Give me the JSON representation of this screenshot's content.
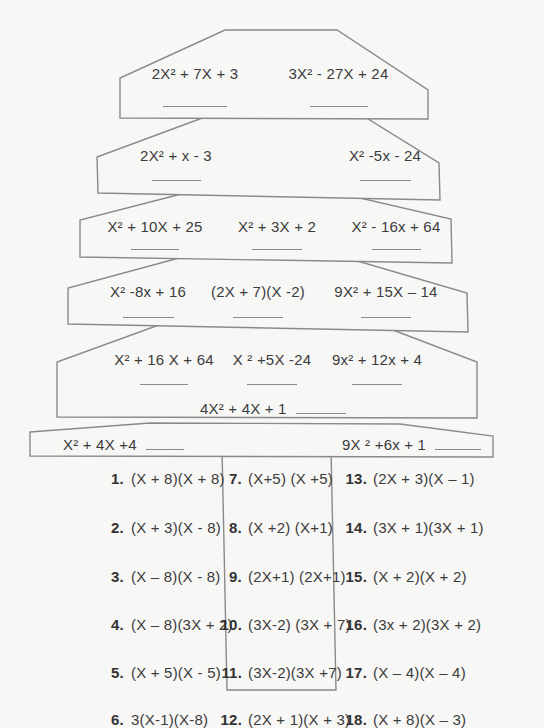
{
  "colors": {
    "background": "#f7f7f5",
    "outline": "#8a8a8a",
    "text": "#3c3c3c"
  },
  "tree": {
    "tiers": [
      {
        "cells": [
          {
            "text": "2X² + 7X + 3"
          },
          {
            "text": "3X² - 27X + 24"
          }
        ]
      },
      {
        "cells": [
          {
            "text": "2X² + x - 3"
          },
          {
            "text": "X² -5x - 24"
          }
        ]
      },
      {
        "cells": [
          {
            "text": "X² + 10X + 25"
          },
          {
            "text": "X² + 3X + 2"
          },
          {
            "text": "X² - 16x + 64"
          }
        ]
      },
      {
        "cells": [
          {
            "text": "X² -8x + 16"
          },
          {
            "text": "(2X + 7)(X -2)"
          },
          {
            "text": "9X² + 15X – 14"
          }
        ]
      },
      {
        "cells": [
          {
            "text": "X² + 16 X + 64"
          },
          {
            "text": "X ² +5X -24"
          },
          {
            "text": "9x² + 12x + 4"
          }
        ],
        "extra": "4X² + 4X + 1"
      },
      {
        "cells": [
          {
            "text": "X² + 4X +4"
          },
          {
            "text": "9X ² +6x + 1"
          }
        ]
      }
    ]
  },
  "answers": {
    "items": [
      {
        "num": "1.",
        "text": "(X + 8)(X + 8)"
      },
      {
        "num": "2.",
        "text": "(X + 3)(X - 8)"
      },
      {
        "num": "3.",
        "text": "(X – 8)(X - 8)"
      },
      {
        "num": "4.",
        "text": "(X – 8)(3X + 2)"
      },
      {
        "num": "5.",
        "text": "(X + 5)(X - 5)"
      },
      {
        "num": "6.",
        "text": "3(X-1)(X-8)"
      },
      {
        "num": "7.",
        "text": "(X+5) (X +5)"
      },
      {
        "num": "8.",
        "text": "(X +2) (X+1)"
      },
      {
        "num": "9.",
        "text": "(2X+1) (2X+1)"
      },
      {
        "num": "10.",
        "text": "(3X-2) (3X + 7)"
      },
      {
        "num": "11.",
        "text": "(3X-2)(3X +7)"
      },
      {
        "num": "12.",
        "text": "(2X + 1)(X + 3)"
      },
      {
        "num": "13.",
        "text": "(2X + 3)(X – 1)"
      },
      {
        "num": "14.",
        "text": "(3X + 1)(3X + 1)"
      },
      {
        "num": "15.",
        "text": "(X + 2)(X + 2)"
      },
      {
        "num": "16.",
        "text": "(3x + 2)(3X + 2)"
      },
      {
        "num": "17.",
        "text": "(X – 4)(X – 4)"
      },
      {
        "num": "18.",
        "text": "(X + 8)(X – 3)"
      }
    ]
  }
}
